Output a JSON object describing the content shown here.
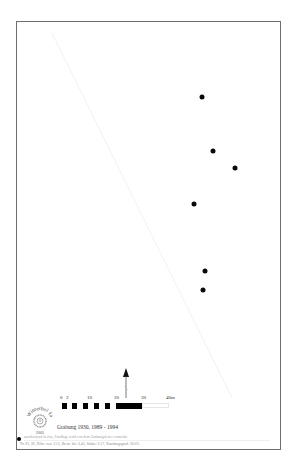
{
  "map": {
    "type": "archaeological find distribution plan",
    "frame_color": "#6e6e6e",
    "dot_color": "#0a0a0a",
    "find_points": [
      {
        "x": 202,
        "y": 97
      },
      {
        "x": 213,
        "y": 151
      },
      {
        "x": 235,
        "y": 168
      },
      {
        "x": 194,
        "y": 204
      },
      {
        "x": 205,
        "y": 271
      },
      {
        "x": 203,
        "y": 290
      }
    ]
  },
  "scale_bar": {
    "labels": [
      {
        "text": "0",
        "x": 60
      },
      {
        "text": "2",
        "x": 66
      },
      {
        "text": "10",
        "x": 87
      },
      {
        "text": "20",
        "x": 114
      },
      {
        "text": "30",
        "x": 141
      },
      {
        "text": "40m",
        "x": 166
      }
    ],
    "unit": "m"
  },
  "north_arrow": {
    "icon": "north-arrow-icon"
  },
  "logo": {
    "text_top": "Winterbol 1a",
    "text_bottom": "2005",
    "center": "W"
  },
  "caption": "Grabung 1930, 1989 - 1994",
  "legend": {
    "symbol": "filled-dot",
    "line1": "anscheinend in situ, Fundlage wird von dem Grabungsleiter vermerkt",
    "line2": "Nr. 81, 82, Höhe von: 3.55, Breite bis: 0.40, Stärke: 0.27, Rundungsgrad: 36.0%"
  }
}
